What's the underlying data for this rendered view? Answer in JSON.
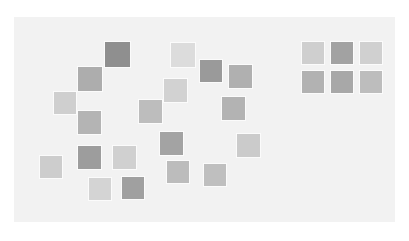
{
  "figure": {
    "background_color": "#ffffff",
    "canvas_color": "#f2f2f2",
    "square_border_color": "#fbfbfb",
    "width": 409,
    "height": 241
  },
  "canvas": {
    "x": 14,
    "y": 17,
    "width": 381,
    "height": 205
  },
  "chart_data": {
    "type": "scatter",
    "subtitle": "",
    "xlabel": "",
    "ylabel": "",
    "grid": false,
    "legend": null,
    "xlim": [
      0,
      409
    ],
    "ylim": [
      0,
      241
    ],
    "marker": "square",
    "note": "Pixel coordinates of square top-left corners; value encodes gray level 0-255.",
    "series": [
      {
        "name": "scatter-cluster",
        "count": 18,
        "points": [
          {
            "id": "s1",
            "x": 104,
            "y": 41,
            "size": 27,
            "color": "#8f8f8f",
            "value": 143
          },
          {
            "id": "s2",
            "x": 170,
            "y": 42,
            "size": 26,
            "color": "#dcdcdc",
            "value": 220
          },
          {
            "id": "s3",
            "x": 199,
            "y": 59,
            "size": 24,
            "color": "#9a9a9a",
            "value": 154
          },
          {
            "id": "s4",
            "x": 228,
            "y": 64,
            "size": 25,
            "color": "#b0b0b0",
            "value": 176
          },
          {
            "id": "s5",
            "x": 77,
            "y": 66,
            "size": 26,
            "color": "#adadad",
            "value": 173
          },
          {
            "id": "s6",
            "x": 163,
            "y": 78,
            "size": 25,
            "color": "#d2d2d2",
            "value": 210
          },
          {
            "id": "s7",
            "x": 53,
            "y": 91,
            "size": 24,
            "color": "#cfcfcf",
            "value": 207
          },
          {
            "id": "s8",
            "x": 138,
            "y": 99,
            "size": 25,
            "color": "#bdbdbd",
            "value": 189
          },
          {
            "id": "s9",
            "x": 221,
            "y": 96,
            "size": 25,
            "color": "#b3b3b3",
            "value": 179
          },
          {
            "id": "s10",
            "x": 77,
            "y": 110,
            "size": 25,
            "color": "#b4b4b4",
            "value": 180
          },
          {
            "id": "s11",
            "x": 159,
            "y": 131,
            "size": 25,
            "color": "#a3a3a3",
            "value": 163
          },
          {
            "id": "s12",
            "x": 236,
            "y": 133,
            "size": 25,
            "color": "#cbcbcb",
            "value": 203
          },
          {
            "id": "s13",
            "x": 77,
            "y": 145,
            "size": 25,
            "color": "#9d9d9d",
            "value": 157
          },
          {
            "id": "s14",
            "x": 112,
            "y": 145,
            "size": 25,
            "color": "#d0d0d0",
            "value": 208
          },
          {
            "id": "s15",
            "x": 166,
            "y": 160,
            "size": 24,
            "color": "#bcbcbc",
            "value": 188
          },
          {
            "id": "s16",
            "x": 39,
            "y": 155,
            "size": 24,
            "color": "#cdcdcd",
            "value": 205
          },
          {
            "id": "s17",
            "x": 203,
            "y": 163,
            "size": 24,
            "color": "#bfbfbf",
            "value": 191
          },
          {
            "id": "s18",
            "x": 121,
            "y": 176,
            "size": 24,
            "color": "#a0a0a0",
            "value": 160
          },
          {
            "id": "s19",
            "x": 88,
            "y": 177,
            "size": 24,
            "color": "#d4d4d4",
            "value": 212
          }
        ]
      },
      {
        "name": "ordered-grid",
        "count": 6,
        "rows": 2,
        "cols": 3,
        "cell_size": 24,
        "gap": 5,
        "origin_x": 301,
        "origin_y": 41,
        "points": [
          {
            "id": "g1",
            "row": 0,
            "col": 0,
            "color": "#cfcfcf",
            "value": 207
          },
          {
            "id": "g2",
            "row": 0,
            "col": 1,
            "color": "#a2a2a2",
            "value": 162
          },
          {
            "id": "g3",
            "row": 0,
            "col": 2,
            "color": "#d0d0d0",
            "value": 208
          },
          {
            "id": "g4",
            "row": 1,
            "col": 0,
            "color": "#b2b2b2",
            "value": 178
          },
          {
            "id": "g5",
            "row": 1,
            "col": 1,
            "color": "#a8a8a8",
            "value": 168
          },
          {
            "id": "g6",
            "row": 1,
            "col": 2,
            "color": "#bdbdbd",
            "value": 189
          }
        ]
      }
    ]
  }
}
